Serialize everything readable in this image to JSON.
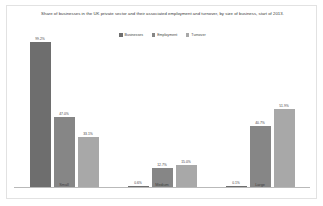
{
  "chart_data": {
    "type": "bar",
    "title": "Share of businesses in the UK private sector and their associated employment and turnover, by size of business, start of 2013.",
    "xlabel": "",
    "ylabel": "",
    "ylim": [
      0,
      100
    ],
    "grid": false,
    "legend_position": "top-center",
    "categories": [
      "Small",
      "Medium",
      "Large"
    ],
    "series": [
      {
        "name": "Businesses",
        "color": "#6e6e6e",
        "values": [
          99.2,
          0.6,
          0.1
        ],
        "labels": [
          "99.2%",
          "0.6%",
          "0.1%"
        ]
      },
      {
        "name": "Employment",
        "color": "#868686",
        "values": [
          47.0,
          12.7,
          40.7
        ],
        "labels": [
          "47.0%",
          "12.7%",
          "40.7%"
        ]
      },
      {
        "name": "Turnover",
        "color": "#a8a8a8",
        "values": [
          33.1,
          15.0,
          51.9
        ],
        "labels": [
          "33.1%",
          "15.0%",
          "51.9%"
        ]
      }
    ]
  }
}
